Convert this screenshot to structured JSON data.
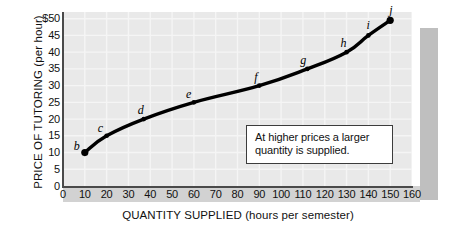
{
  "chart_data": {
    "type": "line",
    "title": "",
    "xlabel": "QUANTITY SUPPLIED (hours per semester)",
    "ylabel": "PRICE OF TUTORING (per hour)",
    "xlim": [
      0,
      160
    ],
    "ylim": [
      0,
      52
    ],
    "grid": true,
    "legend": "none",
    "series": [
      {
        "name": "Supply curve",
        "point_labels": [
          "b",
          "c",
          "d",
          "e",
          "f",
          "g",
          "h",
          "i",
          "j"
        ],
        "x": [
          10,
          20,
          37,
          60,
          90,
          112,
          130,
          140,
          150
        ],
        "y": [
          10,
          15,
          20,
          25,
          30,
          35,
          40,
          45,
          49.5
        ]
      }
    ],
    "xticks": [
      "0",
      "10",
      "20",
      "30",
      "40",
      "50",
      "60",
      "70",
      "80",
      "90",
      "100",
      "110",
      "120",
      "130",
      "140",
      "150",
      "160"
    ],
    "yticks": [
      "$50",
      "45",
      "40",
      "35",
      "30",
      "25",
      "20",
      "15",
      "10",
      "5",
      "0"
    ],
    "annotations": [
      {
        "name": "callout",
        "line1": "At higher prices a larger",
        "line2": "quantity is supplied."
      }
    ]
  },
  "axes": {
    "y_title": "PRICE OF TUTORING (per hour)",
    "x_title": "QUANTITY SUPPLIED (hours per semester)",
    "y_ticks": [
      {
        "label": "$50",
        "value": 50
      },
      {
        "label": "45",
        "value": 45
      },
      {
        "label": "40",
        "value": 40
      },
      {
        "label": "35",
        "value": 35
      },
      {
        "label": "30",
        "value": 30
      },
      {
        "label": "25",
        "value": 25
      },
      {
        "label": "20",
        "value": 20
      },
      {
        "label": "15",
        "value": 15
      },
      {
        "label": "10",
        "value": 10
      },
      {
        "label": "5",
        "value": 5
      },
      {
        "label": "0",
        "value": 0
      }
    ],
    "x_ticks": [
      {
        "label": "0",
        "value": 0
      },
      {
        "label": "10",
        "value": 10
      },
      {
        "label": "20",
        "value": 20
      },
      {
        "label": "30",
        "value": 30
      },
      {
        "label": "40",
        "value": 40
      },
      {
        "label": "50",
        "value": 50
      },
      {
        "label": "60",
        "value": 60
      },
      {
        "label": "70",
        "value": 70
      },
      {
        "label": "80",
        "value": 80
      },
      {
        "label": "90",
        "value": 90
      },
      {
        "label": "100",
        "value": 100
      },
      {
        "label": "110",
        "value": 110
      },
      {
        "label": "120",
        "value": 120
      },
      {
        "label": "130",
        "value": 130
      },
      {
        "label": "140",
        "value": 140
      },
      {
        "label": "150",
        "value": 150
      },
      {
        "label": "160",
        "value": 160
      }
    ]
  },
  "points": [
    {
      "label": "b",
      "x": 10,
      "y": 10
    },
    {
      "label": "c",
      "x": 20,
      "y": 15
    },
    {
      "label": "d",
      "x": 37,
      "y": 20
    },
    {
      "label": "e",
      "x": 60,
      "y": 25
    },
    {
      "label": "f",
      "x": 90,
      "y": 30
    },
    {
      "label": "g",
      "x": 112,
      "y": 35
    },
    {
      "label": "h",
      "x": 130,
      "y": 40
    },
    {
      "label": "i",
      "x": 140,
      "y": 45
    },
    {
      "label": "j",
      "x": 150,
      "y": 49.5
    }
  ],
  "callout": {
    "line1": "At higher prices a larger",
    "line2": "quantity is supplied."
  },
  "colors": {
    "plot_background": "#e9e9e9",
    "shadow": "#bfbfbf",
    "axis_band": "#d2d2d2",
    "curve": "#000000",
    "gridline": "#f5f5f5",
    "axis": "#4a4a4a",
    "text": "#111111"
  }
}
